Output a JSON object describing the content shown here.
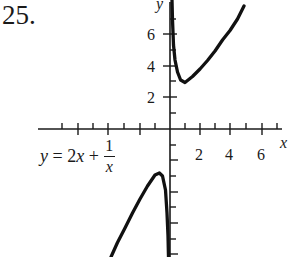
{
  "problem": {
    "number": "25."
  },
  "formula": {
    "lhs": "y = 2x + ",
    "numerator": "1",
    "denominator": "x"
  },
  "axes": {
    "x_label": "x",
    "y_label": "y",
    "x_tick_labels": [
      "2",
      "4",
      "6"
    ],
    "y_tick_labels": [
      "2",
      "4",
      "6"
    ]
  },
  "chart_data": {
    "type": "line",
    "title": "",
    "function": "y = 2x + 1/x",
    "xlabel": "x",
    "ylabel": "y",
    "xlim": [
      -6,
      7
    ],
    "ylim": [
      -8,
      8
    ],
    "x_ticks": [
      -6,
      -5,
      -4,
      -3,
      -2,
      -1,
      0,
      1,
      2,
      3,
      4,
      5,
      6,
      7
    ],
    "x_tick_labels_shown": [
      2,
      4,
      6
    ],
    "y_ticks": [
      -8,
      -7,
      -6,
      -5,
      -4,
      -3,
      -2,
      -1,
      1,
      2,
      3,
      4,
      5,
      6,
      7
    ],
    "y_tick_labels_shown": [
      2,
      4,
      6
    ],
    "grid": false,
    "legend": null,
    "annotations": [
      "y = 2x + 1/x"
    ],
    "series": [
      {
        "name": "right branch (x > 0)",
        "x": [
          0.13,
          0.2,
          0.3,
          0.5,
          0.707,
          1,
          1.5,
          2,
          2.5,
          3,
          3.5
        ],
        "y": [
          7.95,
          5.4,
          3.93,
          3.0,
          2.83,
          3.0,
          3.67,
          4.5,
          5.4,
          6.33,
          7.29
        ]
      },
      {
        "name": "left branch (x < 0)",
        "x": [
          -4.0,
          -3.5,
          -3,
          -2.5,
          -2,
          -1.5,
          -1,
          -0.707,
          -0.5,
          -0.3,
          -0.2,
          -0.13
        ],
        "y": [
          -8.25,
          -7.29,
          -6.33,
          -5.4,
          -4.5,
          -3.67,
          -3.0,
          -2.83,
          -3.0,
          -3.93,
          -5.4,
          -7.95
        ]
      }
    ],
    "features": {
      "vertical_asymptote": "x = 0",
      "slant_asymptote": "y = 2x",
      "local_min": [
        0.707,
        2.83
      ],
      "local_max": [
        -0.707,
        -2.83
      ]
    }
  }
}
